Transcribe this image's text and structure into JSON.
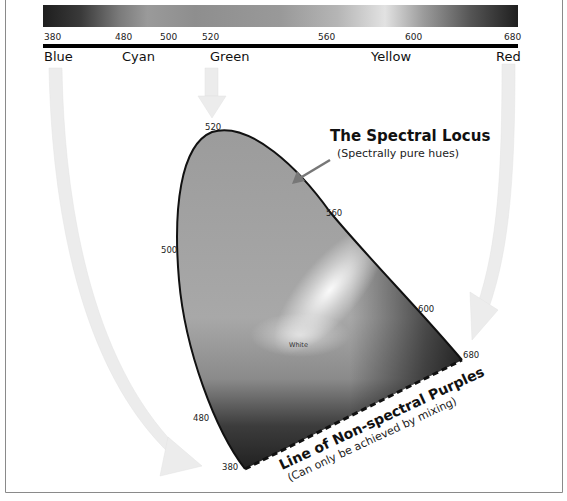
{
  "spectrum_bar": {
    "tick_labels": [
      "380",
      "480",
      "500",
      "520",
      "560",
      "600",
      "680"
    ],
    "color_names": [
      "Blue",
      "Cyan",
      "Green",
      "Yellow",
      "Red"
    ]
  },
  "locus": {
    "title": "The Spectral Locus",
    "subtitle": "(Spectrally pure hues)",
    "wavelength_labels": {
      "w520": "520",
      "w500": "500",
      "w560": "560",
      "w600": "600",
      "w480": "480",
      "w680": "680",
      "w380": "380"
    },
    "white_point_label": "White"
  },
  "purples": {
    "title": "Line of Non-spectral Purples",
    "subtitle": "(Can only be achieved by mixing)"
  },
  "colors": {
    "background": "#ffffff",
    "outline": "#111111",
    "arrow_fill": "#ececec",
    "pointer_arrow": "#777777",
    "frame": "#888888"
  }
}
